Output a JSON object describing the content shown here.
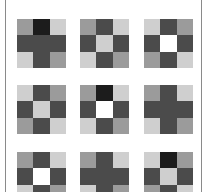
{
  "shades": {
    "VD": "#1c1c1c",
    "D": "#4b4b4b",
    "M": "#9b9b9b",
    "L": "#cfcfcf",
    "W": "#ffffff"
  },
  "frame": {
    "border_color": "#8a8a8a"
  },
  "tiles": [
    {
      "x": 17,
      "y": 19,
      "cells": [
        "M",
        "VD",
        "L",
        "D",
        "D",
        "D",
        "L",
        "D",
        "M"
      ]
    },
    {
      "x": 80,
      "y": 19,
      "cells": [
        "M",
        "D",
        "L",
        "D",
        "L",
        "D",
        "L",
        "D",
        "M"
      ]
    },
    {
      "x": 144,
      "y": 19,
      "cells": [
        "L",
        "D",
        "M",
        "D",
        "W",
        "D",
        "M",
        "D",
        "L"
      ]
    },
    {
      "x": 17,
      "y": 85,
      "cells": [
        "L",
        "D",
        "M",
        "D",
        "L",
        "D",
        "M",
        "D",
        "L"
      ]
    },
    {
      "x": 80,
      "y": 85,
      "cells": [
        "M",
        "VD",
        "L",
        "D",
        "W",
        "D",
        "L",
        "D",
        "M"
      ]
    },
    {
      "x": 144,
      "y": 85,
      "cells": [
        "M",
        "D",
        "L",
        "D",
        "D",
        "D",
        "L",
        "D",
        "M"
      ]
    },
    {
      "x": 17,
      "y": 152,
      "cells": [
        "M",
        "D",
        "L",
        "D",
        "W",
        "D",
        "L",
        "D",
        "M"
      ]
    },
    {
      "x": 80,
      "y": 152,
      "cells": [
        "M",
        "D",
        "L",
        "D",
        "D",
        "D",
        "L",
        "D",
        "M"
      ]
    },
    {
      "x": 144,
      "y": 152,
      "cells": [
        "L",
        "VD",
        "M",
        "D",
        "L",
        "D",
        "M",
        "D",
        "L"
      ]
    }
  ]
}
